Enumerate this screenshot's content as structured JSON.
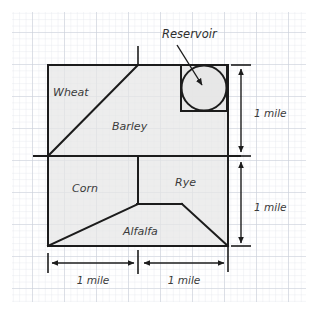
{
  "diagram": {
    "title_present": false,
    "background": "#ffffff",
    "paper": {
      "grid_minor_color": "#e2e6ec",
      "grid_major_color": "#c6ccd6",
      "grid_minor_step_px": 6.4,
      "grid_major_step_px": 32
    },
    "fill_color": "#e6e6e6",
    "stroke_color": "#1c1c1c",
    "fields": [
      {
        "id": "wheat",
        "label": "Wheat",
        "x": 75,
        "y": 92
      },
      {
        "id": "barley",
        "label": "Barley",
        "x": 135,
        "y": 127
      },
      {
        "id": "corn",
        "label": "Corn",
        "x": 93,
        "y": 189
      },
      {
        "id": "rye",
        "label": "Rye",
        "x": 190,
        "y": 183
      },
      {
        "id": "alfalfa",
        "label": "Alfalfa",
        "x": 148,
        "y": 232
      }
    ],
    "callout": {
      "id": "reservoir",
      "label": "Reservoir",
      "label_x": 162,
      "label_y": 38,
      "arrow_from_x": 177,
      "arrow_from_y": 44,
      "arrow_to_x": 203,
      "arrow_to_y": 86,
      "shape": "circle-inscribed-in-square",
      "circle_cx": 204,
      "circle_cy": 88,
      "circle_r": 22,
      "square_x": 181,
      "square_y": 65,
      "square_w": 46,
      "square_h": 46
    },
    "dimensions": [
      {
        "id": "bottom-left",
        "label": "1 mile",
        "orientation": "horizontal",
        "x1": 48,
        "x2": 138,
        "y": 263,
        "label_x": 93,
        "label_y": 281
      },
      {
        "id": "bottom-right",
        "label": "1 mile",
        "orientation": "horizontal",
        "x1": 140,
        "x2": 228,
        "y": 263,
        "label_x": 184,
        "label_y": 281
      },
      {
        "id": "right-top",
        "label": "1 mile",
        "orientation": "vertical",
        "y1": 65,
        "y2": 155,
        "x": 241,
        "label_x": 252,
        "label_y": 113
      },
      {
        "id": "right-bottom",
        "label": "1 mile",
        "orientation": "vertical",
        "y1": 158,
        "y2": 246,
        "x": 241,
        "label_x": 252,
        "label_y": 207
      }
    ],
    "outline_points": "48,65 228,65 228,246 48,246",
    "internal_lines": [
      {
        "id": "wheat-barley-diagonal",
        "from_x": 48,
        "from_y": 156,
        "to_x": 138,
        "to_y": 65
      },
      {
        "id": "mid-horizontal",
        "from_x": 34,
        "from_y": 156,
        "to_x": 240,
        "to_y": 156
      },
      {
        "id": "corn-rye-divider",
        "from_x": 138,
        "from_y": 157,
        "to_x": 138,
        "to_y": 204
      },
      {
        "id": "alfalfa-left-slope",
        "from_x": 48,
        "from_y": 246,
        "to_x": 138,
        "to_y": 204
      },
      {
        "id": "alfalfa-top",
        "from_x": 138,
        "from_y": 204,
        "to_x": 182,
        "to_y": 204
      },
      {
        "id": "alfalfa-right-slope",
        "from_x": 182,
        "from_y": 204,
        "to_x": 228,
        "to_y": 246
      },
      {
        "id": "top-tick",
        "from_x": 138,
        "from_y": 47,
        "to_x": 138,
        "to_y": 65
      },
      {
        "id": "right-extension",
        "from_x": 228,
        "from_y": 246,
        "to_x": 228,
        "to_y": 270
      },
      {
        "id": "mid-divider-tick",
        "from_x": 138,
        "from_y": 252,
        "to_x": 138,
        "to_y": 272
      }
    ]
  }
}
